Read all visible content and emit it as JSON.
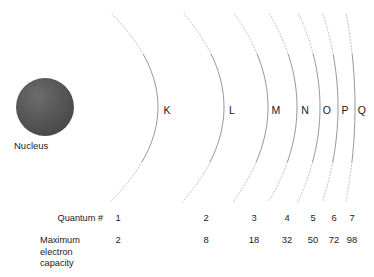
{
  "figure": {
    "type": "atomic-shell-diagram",
    "background_color": "#ffffff",
    "arc_color": "#8a8a8a",
    "dotted_arc_color": "#b6b6b6",
    "text_color": "#1a1a1a",
    "nucleus_color": "#555555"
  },
  "nucleus": {
    "label": "Nucleus",
    "center_x": 45,
    "center_y": 107,
    "radius": 29
  },
  "shells": [
    {
      "letter": "K",
      "quantum_number": "1",
      "max_electrons": "2",
      "label_x": 167,
      "apex_x": 158,
      "value_x": 118
    },
    {
      "letter": "L",
      "quantum_number": "2",
      "max_electrons": "8",
      "label_x": 232,
      "apex_x": 224,
      "value_x": 206
    },
    {
      "letter": "M",
      "quantum_number": "3",
      "max_electrons": "18",
      "label_x": 276,
      "apex_x": 268,
      "value_x": 254
    },
    {
      "letter": "N",
      "quantum_number": "4",
      "max_electrons": "32",
      "label_x": 305,
      "apex_x": 297,
      "value_x": 287
    },
    {
      "letter": "O",
      "quantum_number": "5",
      "max_electrons": "50",
      "label_x": 327,
      "apex_x": 320,
      "value_x": 313
    },
    {
      "letter": "P",
      "quantum_number": "6",
      "max_electrons": "72",
      "label_x": 345,
      "apex_x": 338,
      "value_x": 334
    },
    {
      "letter": "Q",
      "quantum_number": "7",
      "max_electrons": "98",
      "label_x": 362,
      "apex_x": 355,
      "value_x": 352
    }
  ],
  "rows": {
    "quantum_number": {
      "label": "Quantum #",
      "label_x": 103,
      "y": 213
    },
    "max_capacity": {
      "label_line_1": "Maximum",
      "label_line_2": "electron",
      "label_line_3": "capacity",
      "label_x": 40,
      "y": 235
    }
  }
}
